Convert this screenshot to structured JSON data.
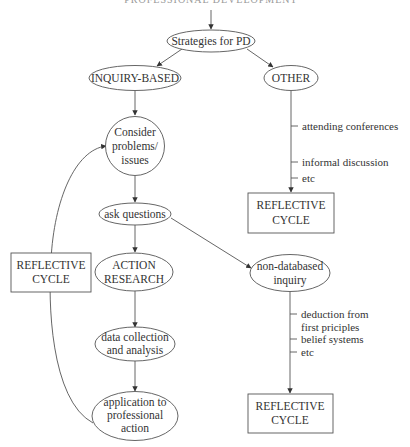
{
  "title": "PROFESSIONAL DEVELOPMENT",
  "nodes": {
    "strategies": {
      "label": "Strategies for PD"
    },
    "inquiry": {
      "label": "INQUIRY-BASED"
    },
    "other": {
      "label": "OTHER"
    },
    "consider": {
      "lines": [
        "Consider",
        "problems/",
        "issues"
      ]
    },
    "ask": {
      "label": "ask questions"
    },
    "action": {
      "lines": [
        "ACTION",
        "RESEARCH"
      ]
    },
    "data": {
      "lines": [
        "data collection",
        "and analysis"
      ]
    },
    "application": {
      "lines": [
        "application to",
        "professional",
        "action"
      ]
    },
    "nondatabased": {
      "lines": [
        "non-databased",
        "inquiry"
      ]
    },
    "reflective_left": {
      "lines": [
        "REFLECTIVE",
        "CYCLE"
      ]
    },
    "reflective_right_top": {
      "lines": [
        "REFLECTIVE",
        "CYCLE"
      ]
    },
    "reflective_right_bottom": {
      "lines": [
        "REFLECTIVE",
        "CYCLE"
      ]
    }
  },
  "other_examples": [
    "attending conferences",
    "informal discussion",
    "etc"
  ],
  "nondatabased_examples": [
    "deduction from",
    "first priciples",
    "belief systems",
    "etc"
  ],
  "colors": {
    "stroke": "#555555",
    "text": "#333333",
    "background": "#ffffff"
  }
}
